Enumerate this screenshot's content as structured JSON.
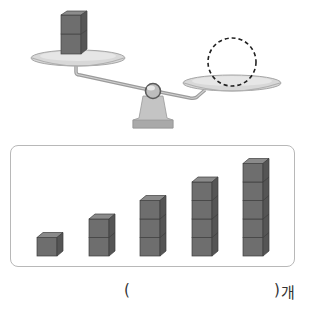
{
  "question": {
    "top_text_partial": "",
    "answer_open": "(",
    "answer_close": ")",
    "answer_unit": "개"
  },
  "scale": {
    "left_pan_cubes": 2,
    "right_pan": "dashed-circle-placeholder",
    "colors": {
      "cube_front": "#6e6e6e",
      "cube_top": "#8a8a8a",
      "cube_side": "#555555",
      "pan": "#d6d6d6",
      "pan_edge": "#a8a8a8",
      "base": "#b9b9b9",
      "beam": "#a0a0a0"
    }
  },
  "choices": {
    "stacks": [
      {
        "count": 1
      },
      {
        "count": 2
      },
      {
        "count": 3
      },
      {
        "count": 4
      },
      {
        "count": 5
      }
    ],
    "border_color": "#b8b8b8"
  }
}
